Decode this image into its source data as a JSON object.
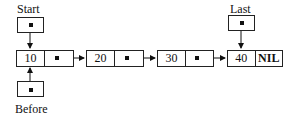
{
  "pointers": {
    "start": {
      "label": "Start"
    },
    "last": {
      "label": "Last"
    },
    "before": {
      "label": "Before"
    }
  },
  "nodes": [
    {
      "value": "10",
      "next": "pointer"
    },
    {
      "value": "20",
      "next": "pointer"
    },
    {
      "value": "30",
      "next": "pointer"
    },
    {
      "value": "40",
      "next": "NIL"
    }
  ]
}
